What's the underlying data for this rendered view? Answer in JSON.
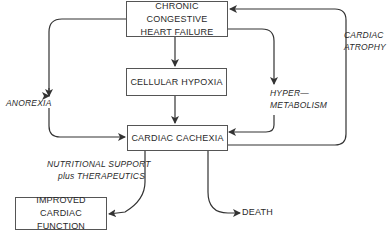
{
  "nodes": {
    "chf": {
      "line1": "CHRONIC CONGESTIVE",
      "line2": "HEART FAILURE"
    },
    "hypoxia": {
      "label": "CELLULAR HYPOXIA"
    },
    "cachexia": {
      "label": "CARDIAC CACHEXIA"
    },
    "improved": {
      "line1": "IMPROVED",
      "line2": "CARDIAC FUNCTION"
    },
    "death": {
      "label": "DEATH"
    }
  },
  "edge_labels": {
    "anorexia": "ANOREXIA",
    "hyper1": "HYPER—",
    "hyper2": "METABOLISM",
    "atrophy1": "CARDIAC",
    "atrophy2": "ATROPHY",
    "support1": "NUTRITIONAL SUPPORT",
    "support2": "plus THERAPEUTICS"
  },
  "colors": {
    "line": "#333333",
    "box_border": "#555555"
  }
}
